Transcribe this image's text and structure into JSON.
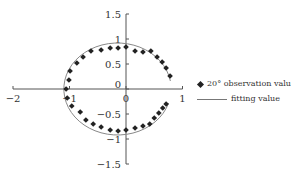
{
  "chart_data": {
    "type": "scatter",
    "title": "",
    "xlabel": "",
    "ylabel": "",
    "xlim": [
      -2,
      1
    ],
    "ylim": [
      -1.5,
      1.5
    ],
    "x_ticks": [
      "-2",
      "-1",
      "0",
      "1"
    ],
    "y_ticks": [
      "1.5",
      "1",
      "0.5",
      "0",
      "-0.5",
      "-1",
      "-1.5"
    ],
    "grid": false,
    "legend_position": "right",
    "series": [
      {
        "name": "20° observation value",
        "marker": "diamond",
        "points": [
          [
            -1.06,
            0.0
          ],
          [
            -1.01,
            0.18
          ],
          [
            -0.99,
            0.36
          ],
          [
            -0.87,
            0.52
          ],
          [
            -0.76,
            0.64
          ],
          [
            -0.62,
            0.76
          ],
          [
            -0.44,
            0.78
          ],
          [
            -0.28,
            0.82
          ],
          [
            -0.14,
            0.82
          ],
          [
            0.0,
            0.84
          ],
          [
            0.16,
            0.76
          ],
          [
            0.3,
            0.74
          ],
          [
            0.44,
            0.76
          ],
          [
            0.55,
            0.64
          ],
          [
            0.64,
            0.54
          ],
          [
            0.71,
            0.42
          ],
          [
            0.78,
            0.26
          ],
          [
            -1.04,
            -0.18
          ],
          [
            -0.96,
            -0.34
          ],
          [
            -0.81,
            -0.46
          ],
          [
            -0.71,
            -0.62
          ],
          [
            -0.58,
            -0.7
          ],
          [
            -0.44,
            -0.76
          ],
          [
            -0.28,
            -0.82
          ],
          [
            -0.14,
            -0.84
          ],
          [
            0.0,
            -0.82
          ],
          [
            0.16,
            -0.78
          ],
          [
            0.3,
            -0.74
          ],
          [
            0.42,
            -0.7
          ],
          [
            0.5,
            -0.58
          ],
          [
            0.58,
            -0.48
          ],
          [
            0.65,
            -0.38
          ],
          [
            0.71,
            -0.3
          ]
        ]
      },
      {
        "name": "fitting value",
        "type": "line",
        "shape": "circle-arc",
        "center": [
          -0.15,
          0
        ],
        "radius_x": 0.95,
        "radius_y": 0.92
      }
    ]
  },
  "legend": {
    "observation": "20° observation value",
    "fitting": "fitting value"
  }
}
